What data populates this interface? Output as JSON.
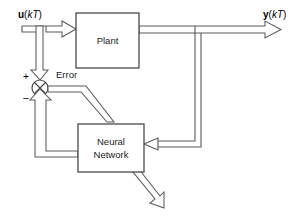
{
  "diagram": {
    "type": "control-block-diagram",
    "canvas": {
      "width": 306,
      "height": 221,
      "background": "#ffffff"
    },
    "colors": {
      "line": "#5a5a5a",
      "block_stroke": "#4a4a4a",
      "text": "#000000",
      "background": "#ffffff"
    },
    "blocks": [
      {
        "id": "plant",
        "label": "Plant",
        "x": 76,
        "y": 13,
        "width": 63,
        "height": 55
      },
      {
        "id": "neural-network",
        "label_line1": "Neural",
        "label_line2": "Network",
        "x": 78,
        "y": 124,
        "width": 66,
        "height": 48
      }
    ],
    "junction": {
      "id": "summing-junction",
      "cx": 40,
      "cy": 88,
      "r": 8,
      "plus_sign": "+",
      "minus_sign": "–"
    },
    "signals": [
      {
        "id": "input-signal",
        "bold_part": "u",
        "paren_open": "(",
        "italic_part": "kT",
        "paren_close": ")"
      },
      {
        "id": "output-signal",
        "bold_part": "y",
        "paren_open": "(",
        "italic_part": "kT",
        "paren_close": ")"
      }
    ],
    "error_label": "Error"
  }
}
